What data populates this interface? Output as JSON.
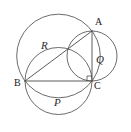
{
  "figure": {
    "canvas": {
      "width": 131,
      "height": 132,
      "background": "#ffffff"
    },
    "stroke_color": "#5a5a5a",
    "label_color": "#1a1a1a",
    "vertices": [
      {
        "name": "A",
        "label": "A",
        "x": 92,
        "y": 31
      },
      {
        "name": "B",
        "label": "B",
        "x": 25,
        "y": 81
      },
      {
        "name": "C",
        "label": "C",
        "x": 92,
        "y": 81
      }
    ],
    "segments": [
      {
        "name": "hypotenuse-AB",
        "from": "A",
        "to": "B"
      },
      {
        "name": "leg-BC",
        "from": "B",
        "to": "C"
      },
      {
        "name": "leg-AC",
        "from": "A",
        "to": "C"
      }
    ],
    "right_angle": {
      "at": "C",
      "marker": "square",
      "size": 5
    },
    "circles": [
      {
        "name": "circle-R",
        "label": "R",
        "diameter_on": "AB",
        "cx": 58.5,
        "cy": 56,
        "r": 41.8,
        "label_x": 45,
        "label_y": 45
      },
      {
        "name": "circle-Q",
        "label": "Q",
        "diameter_on": "AC",
        "cx": 92,
        "cy": 56,
        "r": 25,
        "label_x": 100,
        "label_y": 60
      },
      {
        "name": "circle-P",
        "label": "P",
        "diameter_on": "BC",
        "cx": 58.5,
        "cy": 81,
        "r": 33.5,
        "label_x": 58,
        "label_y": 103
      }
    ]
  }
}
